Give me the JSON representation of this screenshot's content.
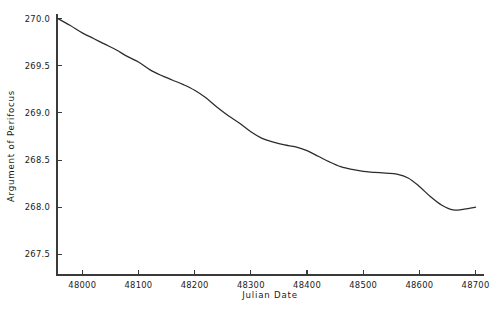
{
  "chart_data": {
    "type": "line",
    "title": "",
    "xlabel": "Julian Date",
    "ylabel": "Argument of Perifocus",
    "xlim": [
      47955,
      48715
    ],
    "ylim": [
      267.28,
      270.05
    ],
    "grid": false,
    "legend": null,
    "xticks": [
      48000,
      48100,
      48200,
      48300,
      48400,
      48500,
      48600,
      48700
    ],
    "xtick_labels": [
      "48000",
      "48100",
      "48200",
      "48300",
      "48400",
      "48500",
      "48600",
      "48700"
    ],
    "yticks": [
      267.5,
      268.0,
      268.5,
      269.0,
      269.5,
      270.0
    ],
    "ytick_labels": [
      "267.5",
      "268.0",
      "268.5",
      "269.0",
      "269.5",
      "270.0"
    ],
    "series": [
      {
        "name": "Argument of Perifocus",
        "color": "#2b2b2b",
        "x": [
          47957,
          47978,
          48000,
          48020,
          48040,
          48060,
          48080,
          48100,
          48120,
          48140,
          48160,
          48180,
          48200,
          48220,
          48240,
          48260,
          48280,
          48300,
          48320,
          48340,
          48360,
          48380,
          48400,
          48420,
          48440,
          48460,
          48480,
          48500,
          48520,
          48540,
          48560,
          48580,
          48600,
          48620,
          48640,
          48660,
          48680,
          48700
        ],
        "y": [
          270.0,
          269.93,
          269.85,
          269.79,
          269.73,
          269.67,
          269.6,
          269.54,
          269.46,
          269.4,
          269.35,
          269.3,
          269.24,
          269.16,
          269.06,
          268.97,
          268.89,
          268.8,
          268.73,
          268.69,
          268.66,
          268.64,
          268.6,
          268.54,
          268.48,
          268.43,
          268.4,
          268.38,
          268.37,
          268.36,
          268.35,
          268.31,
          268.22,
          268.11,
          268.02,
          267.97,
          267.98,
          268.0
        ]
      }
    ]
  },
  "axes": {
    "y_axis_title": "Argument of Perifocus",
    "x_axis_title": "Julian Date"
  }
}
